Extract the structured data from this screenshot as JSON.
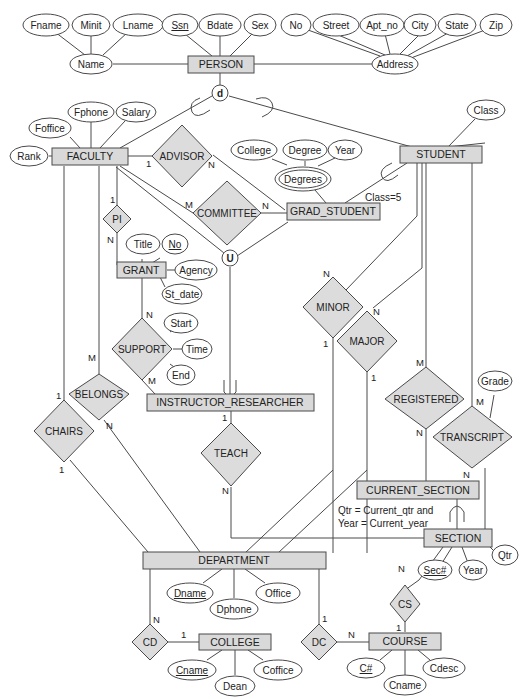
{
  "diagram": {
    "type": "EER diagram",
    "entities": {
      "person": "PERSON",
      "faculty": "FACULTY",
      "student": "STUDENT",
      "grad_student": "GRAD_STUDENT",
      "grant": "GRANT",
      "instructor_researcher": "INSTRUCTOR_RESEARCHER",
      "current_section": "CURRENT_SECTION",
      "section": "SECTION",
      "department": "DEPARTMENT",
      "college": "COLLEGE",
      "course": "COURSE"
    },
    "relationships": {
      "advisor": "ADVISOR",
      "committee": "COMMITTEE",
      "pi": "PI",
      "support": "SUPPORT",
      "belongs": "BELONGS",
      "chairs": "CHAIRS",
      "teach": "TEACH",
      "minor": "MINOR",
      "major": "MAJOR",
      "registered": "REGISTERED",
      "transcript": "TRANSCRIPT",
      "cs": "CS",
      "cd": "CD",
      "dc": "DC"
    },
    "attributes": {
      "fname": "Fname",
      "minit": "Minit",
      "lname": "Lname",
      "ssn": "Ssn",
      "bdate": "Bdate",
      "sex": "Sex",
      "no": "No",
      "street": "Street",
      "apt_no": "Apt_no",
      "city": "City",
      "state": "State",
      "zip": "Zip",
      "name": "Name",
      "address": "Address",
      "fphone": "Fphone",
      "salary": "Salary",
      "foffice": "Foffice",
      "rank": "Rank",
      "class": "Class",
      "college": "College",
      "degree": "Degree",
      "year": "Year",
      "degrees": "Degrees",
      "title": "Title",
      "grant_no": "No",
      "agency": "Agency",
      "st_date": "St_date",
      "start": "Start",
      "time": "Time",
      "end": "End",
      "grade": "Grade",
      "sec_no": "Sec#",
      "sec_year": "Year",
      "qtr": "Qtr",
      "dname": "Dname",
      "dphone": "Dphone",
      "office": "Office",
      "cname": "Cname",
      "dean": "Dean",
      "coffice": "Coffice",
      "c_no": "C#",
      "course_cname": "Cname",
      "cdesc": "Cdesc"
    },
    "specialization": {
      "disjoint": "d",
      "union": "U",
      "class_predicate": "Class=5",
      "current_predicate_line1": "Qtr = Current_qtr and",
      "current_predicate_line2": "Year = Current_year"
    },
    "cardinalities": {
      "advisor_faculty": "1",
      "advisor_grad": "N",
      "committee_faculty": "M",
      "committee_grad": "N",
      "pi_faculty": "1",
      "pi_grant": "N",
      "support_grant": "N",
      "support_ir": "M",
      "belongs_faculty": "M",
      "belongs_dept": "N",
      "chairs_faculty": "1",
      "chairs_dept": "1",
      "teach_ir": "1",
      "teach_section": "N",
      "minor_student": "N",
      "minor_dept": "1",
      "major_student": "N",
      "major_dept": "1",
      "registered_student": "M",
      "registered_section": "N",
      "transcript_student": "M",
      "transcript_section": "N",
      "cs_section": "N",
      "cs_course": "1",
      "cd_dept": "N",
      "cd_college": "1",
      "dc_dept": "1",
      "dc_course": "N"
    }
  }
}
